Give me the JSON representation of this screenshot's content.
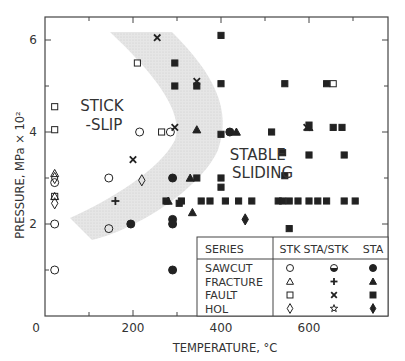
{
  "chart_data": {
    "type": "scatter",
    "title": "",
    "xlabel": "TEMPERATURE, °C",
    "ylabel": "PRESSURE, MPa × 10²",
    "xlim": [
      0,
      780
    ],
    "ylim": [
      0,
      6.5
    ],
    "xticks": [
      0,
      200,
      400,
      600
    ],
    "xminor": [
      100,
      300,
      500,
      700
    ],
    "yticks": [
      2,
      4,
      6
    ],
    "yminor": [
      1,
      3,
      5
    ],
    "grid": false,
    "region_labels": [
      {
        "text": "STICK",
        "x": 80,
        "y": 4.45
      },
      {
        "text": "-SLIP",
        "x": 92,
        "y": 4.05
      },
      {
        "text": "STABLE",
        "x": 420,
        "y": 3.4
      },
      {
        "text": "SLIDING",
        "x": 425,
        "y": 3.0
      }
    ],
    "transition_band": "shaded crescent from (~150,6.2) curving right to (~320,4.0) and back down-left to (~60,2.0)",
    "legend": {
      "header": [
        "SERIES",
        "STK",
        "STA/STK",
        "STA"
      ],
      "rows": [
        {
          "series": "SAWCUT",
          "stk": "open circle",
          "sta_stk": "half-filled circle",
          "sta": "filled circle"
        },
        {
          "series": "FRACTURE",
          "stk": "open triangle",
          "sta_stk": "plus",
          "sta": "filled triangle"
        },
        {
          "series": "FAULT",
          "stk": "open square",
          "sta_stk": "cross",
          "sta": "filled square"
        },
        {
          "series": "HOL",
          "stk": "open diamond",
          "sta_stk": "star",
          "sta": "filled diamond"
        }
      ]
    },
    "series": [
      {
        "name": "SAWCUT STK",
        "marker": "circle-open",
        "points": [
          [
            22,
            1.0
          ],
          [
            22,
            2.0
          ],
          [
            22,
            2.9
          ],
          [
            145,
            1.9
          ],
          [
            145,
            3.0
          ],
          [
            215,
            4.0
          ],
          [
            285,
            4.0
          ]
        ]
      },
      {
        "name": "SAWCUT STA",
        "marker": "circle-filled",
        "points": [
          [
            195,
            2.0
          ],
          [
            290,
            3.0
          ],
          [
            290,
            2.1
          ],
          [
            290,
            2.0
          ],
          [
            290,
            1.0
          ],
          [
            420,
            4.0
          ]
        ]
      },
      {
        "name": "FRACTURE STK",
        "marker": "triangle-open",
        "points": [
          [
            22,
            3.1
          ],
          [
            22,
            2.6
          ]
        ]
      },
      {
        "name": "FRACTURE STA/STK",
        "marker": "plus",
        "points": [
          [
            160,
            2.5
          ]
        ]
      },
      {
        "name": "FRACTURE STA",
        "marker": "triangle-filled",
        "points": [
          [
            345,
            4.05
          ],
          [
            435,
            4.0
          ],
          [
            330,
            3.0
          ],
          [
            280,
            2.5
          ],
          [
            335,
            2.25
          ],
          [
            600,
            4.1
          ]
        ]
      },
      {
        "name": "FAULT STK",
        "marker": "square-open",
        "points": [
          [
            22,
            4.55
          ],
          [
            22,
            4.05
          ],
          [
            22,
            2.6
          ],
          [
            210,
            5.5
          ],
          [
            265,
            4.0
          ],
          [
            655,
            5.05
          ]
        ]
      },
      {
        "name": "FAULT STA/STK",
        "marker": "cross",
        "points": [
          [
            255,
            6.05
          ],
          [
            345,
            5.1
          ],
          [
            295,
            4.1
          ],
          [
            200,
            3.4
          ],
          [
            595,
            4.1
          ]
        ]
      },
      {
        "name": "FAULT STA",
        "marker": "square-filled",
        "points": [
          [
            295,
            5.5
          ],
          [
            295,
            5.0
          ],
          [
            345,
            5.0
          ],
          [
            400,
            6.1
          ],
          [
            400,
            5.05
          ],
          [
            545,
            5.05
          ],
          [
            640,
            5.05
          ],
          [
            400,
            3.95
          ],
          [
            515,
            4.0
          ],
          [
            600,
            4.15
          ],
          [
            655,
            4.1
          ],
          [
            675,
            4.1
          ],
          [
            540,
            3.55
          ],
          [
            600,
            3.5
          ],
          [
            680,
            3.5
          ],
          [
            545,
            3.05
          ],
          [
            345,
            3.0
          ],
          [
            400,
            3.0
          ],
          [
            400,
            2.8
          ],
          [
            275,
            2.5
          ],
          [
            310,
            2.5
          ],
          [
            355,
            2.5
          ],
          [
            375,
            2.5
          ],
          [
            410,
            2.5
          ],
          [
            440,
            2.5
          ],
          [
            470,
            2.5
          ],
          [
            530,
            2.5
          ],
          [
            540,
            2.5
          ],
          [
            555,
            2.5
          ],
          [
            575,
            2.5
          ],
          [
            600,
            2.5
          ],
          [
            620,
            2.5
          ],
          [
            640,
            2.5
          ],
          [
            680,
            2.5
          ],
          [
            705,
            2.5
          ],
          [
            555,
            1.9
          ],
          [
            305,
            2.45
          ]
        ]
      },
      {
        "name": "HOL STK",
        "marker": "diamond-open",
        "points": [
          [
            22,
            3.0
          ],
          [
            22,
            2.45
          ],
          [
            220,
            2.95
          ]
        ]
      },
      {
        "name": "HOL STA",
        "marker": "diamond-filled",
        "points": [
          [
            455,
            2.1
          ]
        ]
      }
    ]
  }
}
